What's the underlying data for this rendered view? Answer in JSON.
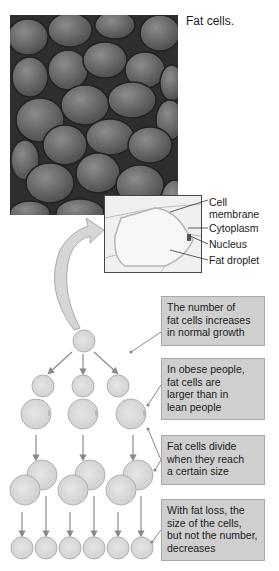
{
  "figure": {
    "caption": "Fat cells.",
    "inset_labels": {
      "cell_membrane_line1": "Cell",
      "cell_membrane_line2": "membrane",
      "cytoplasm": "Cytoplasm",
      "nucleus": "Nucleus",
      "fat_droplet": "Fat droplet"
    },
    "callouts": [
      {
        "lines": [
          "The number of",
          "fat cells increases",
          "in normal growth"
        ]
      },
      {
        "lines": [
          "In obese people,",
          "fat cells are",
          "larger than in",
          "lean people"
        ]
      },
      {
        "lines": [
          "Fat cells divide",
          "when they reach",
          "a certain size"
        ]
      },
      {
        "lines": [
          "With fat loss, the",
          "size of the cells,",
          "but not the number,",
          "decreases"
        ]
      }
    ],
    "colors": {
      "callout_bg": "#cfcfcf",
      "cell_fill": "#d9d9d9",
      "arrow": "#8a8a8a"
    }
  }
}
